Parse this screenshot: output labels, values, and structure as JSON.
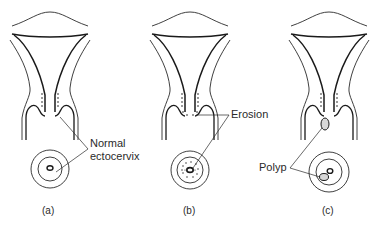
{
  "figure": {
    "panels": [
      {
        "id": "a",
        "caption": "(a)",
        "label_lines": [
          "Normal",
          "ectocervix"
        ],
        "condition": "normal"
      },
      {
        "id": "b",
        "caption": "(b)",
        "label_lines": [
          "Erosion"
        ],
        "condition": "erosion"
      },
      {
        "id": "c",
        "caption": "(c)",
        "label_lines": [
          "Polyp"
        ],
        "condition": "polyp"
      }
    ],
    "colors": {
      "line": "#2a2a2a",
      "background": "#ffffff"
    }
  }
}
